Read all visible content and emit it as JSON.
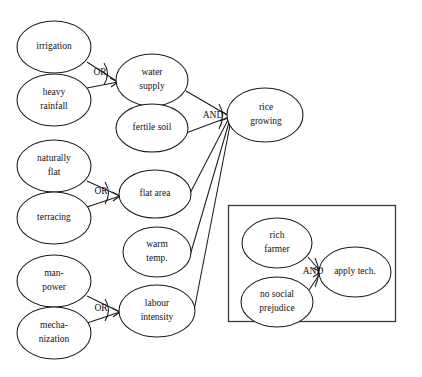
{
  "diagram": {
    "background_color": "#ffffff",
    "stroke_color": "#1a1a1a",
    "nodes": [
      {
        "id": "irrigation",
        "label_lines": [
          "irrigation"
        ],
        "cx": 54,
        "cy": 47,
        "rx": 37,
        "ry": 26
      },
      {
        "id": "heavy-rainfall",
        "label_lines": [
          "heavy",
          "rainfall"
        ],
        "cx": 54,
        "cy": 100,
        "rx": 37,
        "ry": 26
      },
      {
        "id": "naturally-flat",
        "label_lines": [
          "naturally",
          "flat"
        ],
        "cx": 54,
        "cy": 166,
        "rx": 37,
        "ry": 26
      },
      {
        "id": "terracing",
        "label_lines": [
          "terracing"
        ],
        "cx": 54,
        "cy": 218,
        "rx": 37,
        "ry": 26
      },
      {
        "id": "man-power",
        "label_lines": [
          "man-",
          "power"
        ],
        "cx": 54,
        "cy": 281,
        "rx": 37,
        "ry": 26
      },
      {
        "id": "mechanization",
        "label_lines": [
          "mecha-",
          "nization"
        ],
        "cx": 54,
        "cy": 333,
        "rx": 37,
        "ry": 26
      },
      {
        "id": "water-supply",
        "label_lines": [
          "water",
          "supply"
        ],
        "cx": 152,
        "cy": 80,
        "rx": 36,
        "ry": 26
      },
      {
        "id": "fertile-soil",
        "label_lines": [
          "fertile soil"
        ],
        "cx": 152,
        "cy": 128,
        "rx": 36,
        "ry": 24
      },
      {
        "id": "flat-area",
        "label_lines": [
          "flat area"
        ],
        "cx": 155,
        "cy": 194,
        "rx": 36,
        "ry": 24
      },
      {
        "id": "warm-temp",
        "label_lines": [
          "warm",
          "temp."
        ],
        "cx": 157,
        "cy": 252,
        "rx": 34,
        "ry": 25
      },
      {
        "id": "labour-intensity",
        "label_lines": [
          "labour",
          "intensity"
        ],
        "cx": 157,
        "cy": 311,
        "rx": 38,
        "ry": 26
      },
      {
        "id": "rice-growing",
        "label_lines": [
          "rice",
          "growing"
        ],
        "cx": 265,
        "cy": 115,
        "rx": 38,
        "ry": 27
      },
      {
        "id": "rich-farmer",
        "label_lines": [
          "rich",
          "farmer"
        ],
        "cx": 277,
        "cy": 243,
        "rx": 35,
        "ry": 25
      },
      {
        "id": "no-social-prejudice",
        "label_lines": [
          "no social",
          "prejudice"
        ],
        "cx": 277,
        "cy": 302,
        "rx": 36,
        "ry": 25
      },
      {
        "id": "apply-tech",
        "label_lines": [
          "apply tech."
        ],
        "cx": 355,
        "cy": 272,
        "rx": 36,
        "ry": 25
      }
    ],
    "gates": [
      {
        "id": "gate-or-water",
        "label": "OR",
        "x": 100,
        "y": 73
      },
      {
        "id": "gate-or-flat",
        "label": "OR",
        "x": 101,
        "y": 192
      },
      {
        "id": "gate-or-labour",
        "label": "OR",
        "x": 101,
        "y": 309
      },
      {
        "id": "gate-and-rice",
        "label": "AND",
        "x": 213,
        "y": 116
      },
      {
        "id": "gate-and-tech",
        "label": "AND",
        "x": 313,
        "y": 272
      }
    ],
    "edges": [
      {
        "from": "irrigation",
        "to": "water-supply",
        "gate": "OR"
      },
      {
        "from": "heavy-rainfall",
        "to": "water-supply",
        "gate": "OR"
      },
      {
        "from": "naturally-flat",
        "to": "flat-area",
        "gate": "OR"
      },
      {
        "from": "terracing",
        "to": "flat-area",
        "gate": "OR"
      },
      {
        "from": "man-power",
        "to": "labour-intensity",
        "gate": "OR"
      },
      {
        "from": "mechanization",
        "to": "labour-intensity",
        "gate": "OR"
      },
      {
        "from": "water-supply",
        "to": "rice-growing",
        "gate": "AND"
      },
      {
        "from": "fertile-soil",
        "to": "rice-growing",
        "gate": "AND"
      },
      {
        "from": "flat-area",
        "to": "rice-growing",
        "gate": "AND"
      },
      {
        "from": "warm-temp",
        "to": "rice-growing",
        "gate": "AND"
      },
      {
        "from": "labour-intensity",
        "to": "rice-growing",
        "gate": "AND"
      },
      {
        "from": "rich-farmer",
        "to": "apply-tech",
        "gate": "AND"
      },
      {
        "from": "no-social-prejudice",
        "to": "apply-tech",
        "gate": "AND"
      }
    ],
    "inset_box": {
      "x": 228,
      "y": 205,
      "width": 168,
      "height": 117
    }
  }
}
